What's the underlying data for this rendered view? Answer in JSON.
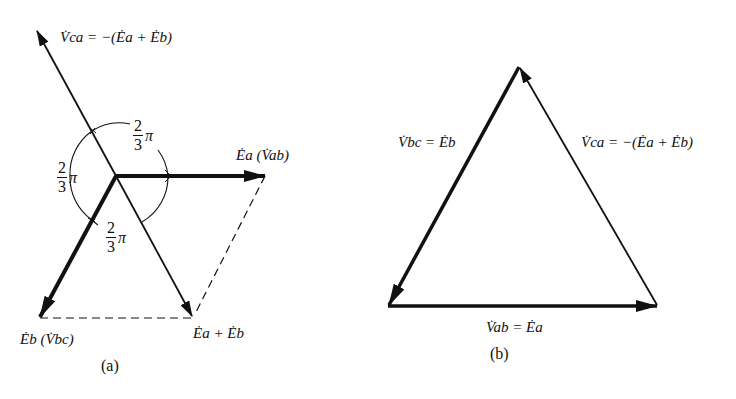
{
  "figure": {
    "panel_a": {
      "caption": "(a)",
      "labels": {
        "v_ca": "V̇ca = −(Ėa + Ėb)",
        "e_a": "Ėa (V̇ab)",
        "e_b": "Ėb (V̇bc)",
        "e_sum": "Ėa + Ėb"
      },
      "angles": [
        {
          "numerator": "2",
          "denominator": "3",
          "symbol": "π"
        },
        {
          "numerator": "2",
          "denominator": "3",
          "symbol": "π"
        },
        {
          "numerator": "2",
          "denominator": "3",
          "symbol": "π"
        }
      ]
    },
    "panel_b": {
      "caption": "(b)",
      "labels": {
        "v_bc": "V̇bc = Ėb",
        "v_ca": "V̇ca = −(Ėa + Ėb)",
        "v_ab": "V̇ab = Ėa"
      }
    },
    "colors": {
      "ink": "#111111",
      "background": "#ffffff"
    }
  }
}
